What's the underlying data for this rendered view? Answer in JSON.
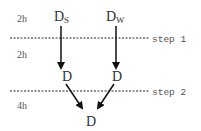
{
  "diagram": {
    "time_labels": [
      "2h",
      "2h",
      "4h"
    ],
    "steps": [
      "step 1",
      "step 2"
    ],
    "top_nodes": [
      {
        "main": "D",
        "sub": "S"
      },
      {
        "main": "D",
        "sub": "W"
      }
    ],
    "mid_nodes": [
      "D",
      "D"
    ],
    "bottom_node": "D"
  }
}
